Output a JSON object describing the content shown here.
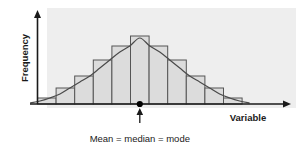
{
  "figure": {
    "title": "",
    "background_color": "#ffffff",
    "panel_color": "#eeeeee"
  },
  "labels": {
    "y_axis": "Frequency",
    "x_axis": "Variable",
    "caption": "Mean = median = mode"
  },
  "colors": {
    "bar_fill": "#dcdcdc",
    "bar_stroke": "#555555",
    "curve": "#4a4a4a",
    "axis": "#1a1a1a",
    "marker": "#000000",
    "text": "#1a1a1a"
  },
  "marker": {
    "name": "center-marker",
    "x_value": 5.5,
    "label": "Mean = median = mode"
  },
  "chart_data": {
    "type": "bar",
    "title": "",
    "subtitle": "",
    "xlabel": "Variable",
    "ylabel": "Frequency",
    "categories": [
      "1",
      "2",
      "3",
      "4",
      "5",
      "6",
      "7",
      "8",
      "9",
      "10",
      "11"
    ],
    "values": [
      6,
      16,
      28,
      44,
      58,
      68,
      58,
      44,
      28,
      16,
      6
    ],
    "ylim": [
      0,
      72
    ],
    "xlim": [
      0,
      11
    ],
    "grid": false,
    "legend": null,
    "tick_labels_x": [],
    "tick_labels_y": [],
    "annotations": [
      {
        "text": "Mean = median = mode",
        "points_to": "center of distribution",
        "x_value": 5.5,
        "y_value": 0
      }
    ],
    "overlay_series": [
      {
        "name": "normal-curve",
        "type": "line",
        "description": "smooth bell-shaped normal distribution curve fitted over the histogram",
        "x": [
          0.0,
          0.5,
          1.0,
          1.5,
          2.0,
          2.5,
          3.0,
          3.5,
          4.0,
          4.5,
          5.0,
          5.5,
          6.0,
          6.5,
          7.0,
          7.5,
          8.0,
          8.5,
          9.0,
          9.5,
          10.0,
          10.5,
          11.0
        ],
        "y": [
          1,
          3,
          6,
          10,
          16,
          22,
          28,
          36,
          44,
          52,
          58,
          66,
          58,
          52,
          44,
          36,
          28,
          22,
          16,
          10,
          6,
          3,
          1
        ]
      }
    ]
  }
}
